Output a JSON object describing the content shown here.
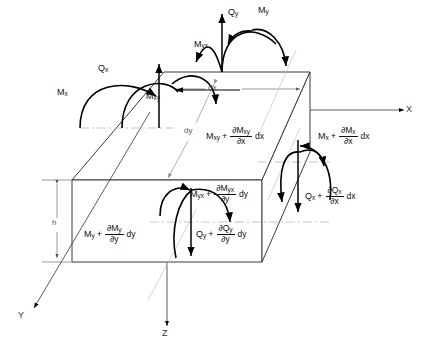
{
  "figure": {
    "type": "free-body-diagram",
    "background": "#ffffff",
    "line_color": "#3a3a3a",
    "arrow_color": "#000000",
    "guide_color": "#b9b9b9"
  },
  "axes": [
    {
      "name": "x-axis",
      "label": "X",
      "direction": "right"
    },
    {
      "name": "y-axis",
      "label": "Y",
      "direction": "down-left"
    },
    {
      "name": "z-axis",
      "label": "Z",
      "direction": "down"
    }
  ],
  "dimensions": [
    {
      "name": "dx",
      "label": "dx",
      "note": "top face width along x"
    },
    {
      "name": "dy",
      "label": "dy",
      "note": "top face depth along y"
    },
    {
      "name": "h",
      "label": "h",
      "note": "plate thickness"
    }
  ],
  "back_face_loads": [
    {
      "name": "Mx",
      "base": "M",
      "sub": "x",
      "incremented": false
    },
    {
      "name": "Qx",
      "base": "Q",
      "sub": "x",
      "incremented": false
    },
    {
      "name": "Mxy",
      "base": "M",
      "sub": "xy",
      "incremented": false
    },
    {
      "name": "Qy",
      "base": "Q",
      "sub": "y",
      "incremented": false
    },
    {
      "name": "My",
      "base": "M",
      "sub": "y",
      "incremented": false
    },
    {
      "name": "Myx",
      "base": "M",
      "sub": "yx",
      "incremented": false
    }
  ],
  "incremented_loads": [
    {
      "name": "Mxy-incremented",
      "base": "M",
      "sub": "xy",
      "numerator_symbol": "∂M",
      "numerator_sub": "xy",
      "denominator_symbol": "∂x",
      "differential": "dx"
    },
    {
      "name": "Mx-incremented",
      "base": "M",
      "sub": "x",
      "numerator_symbol": "∂M",
      "numerator_sub": "x",
      "denominator_symbol": "∂x",
      "differential": "dx"
    },
    {
      "name": "Qx-incremented",
      "base": "Q",
      "sub": "x",
      "numerator_symbol": "∂Q",
      "numerator_sub": "x",
      "denominator_symbol": "∂x",
      "differential": "dx"
    },
    {
      "name": "Myx-incremented",
      "base": "M",
      "sub": "yx",
      "numerator_symbol": "∂M",
      "numerator_sub": "yx",
      "denominator_symbol": "∂y",
      "differential": "dy"
    },
    {
      "name": "My-incremented",
      "base": "M",
      "sub": "y",
      "numerator_symbol": "∂M",
      "numerator_sub": "y",
      "denominator_symbol": "∂y",
      "differential": "dy"
    },
    {
      "name": "Qy-incremented",
      "base": "Q",
      "sub": "y",
      "numerator_symbol": "∂Q",
      "numerator_sub": "y",
      "denominator_symbol": "∂y",
      "differential": "dy"
    }
  ]
}
